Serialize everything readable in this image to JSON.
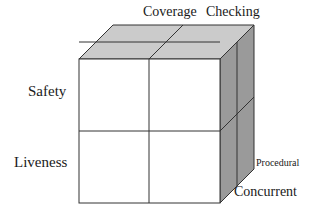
{
  "figure": {
    "colors": {
      "top_face_fill": "#cbcbcb",
      "side_face_fill": "#9a9a9a",
      "front_face_fill": "#ffffff",
      "stroke": "#333333",
      "text": "#1a1a1a"
    }
  },
  "labels": {
    "top_left": "Coverage",
    "top_right": "Checking",
    "front_upper": "Safety",
    "front_lower": "Liveness",
    "side_upper": "Procedural",
    "side_lower": "Concurrent"
  },
  "geometry": {
    "front_face": {
      "left": 79,
      "top": 59,
      "right": 220,
      "bottom": 203
    },
    "depth_offset": {
      "dx": 34,
      "dy": -34
    },
    "front_divider_x": 149,
    "front_divider_y": 131,
    "stroke_width": 1
  },
  "axes": [
    {
      "name": "horizontal",
      "categories": [
        "Coverage",
        "Checking"
      ]
    },
    {
      "name": "vertical",
      "categories": [
        "Safety",
        "Liveness"
      ]
    },
    {
      "name": "depth",
      "categories": [
        "Procedural",
        "Concurrent"
      ]
    }
  ]
}
